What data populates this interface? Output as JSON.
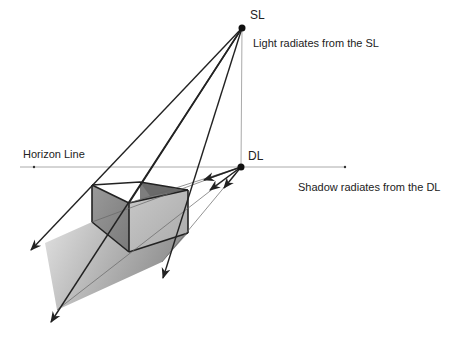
{
  "diagram": {
    "labels": {
      "sun_light": "SL",
      "direction_light": "DL",
      "horizon": "Horizon Line",
      "light_caption": "Light radiates from the SL",
      "shadow_caption": "Shadow radiates from the DL"
    },
    "points": {
      "SL": [
        242,
        28
      ],
      "DL": [
        241,
        167
      ]
    },
    "colors": {
      "line": "#222222",
      "horizon": "#999999",
      "thin_line": "#555555",
      "box_left_face": "#8a8a8a",
      "box_right_face": "#bdbdbd",
      "box_back_face": "#777777",
      "shadow_light": "#d8d8d8",
      "shadow_dark": "#8e8e8e"
    }
  }
}
